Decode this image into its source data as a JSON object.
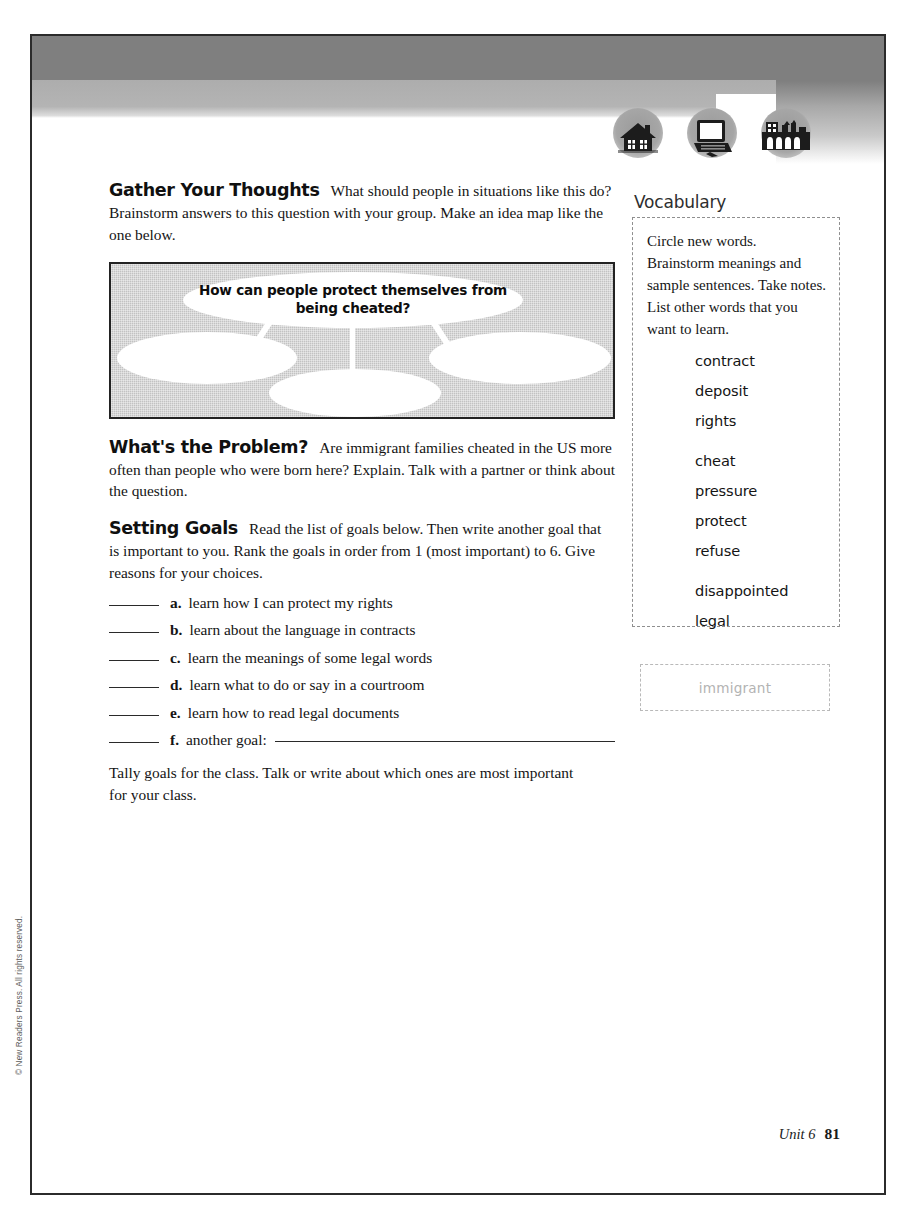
{
  "page": {
    "footer_unit": "Unit 6",
    "footer_page_number": "81",
    "copyright": "© New Readers Press. All rights reserved."
  },
  "header": {
    "icons": [
      {
        "name": "house-icon",
        "label": "house"
      },
      {
        "name": "computer-icon",
        "label": "computer"
      },
      {
        "name": "city-buildings-icon",
        "label": "city buildings"
      }
    ]
  },
  "sections": [
    {
      "heading": "Gather Your Thoughts",
      "body": "What should people in situations like this do? Brainstorm answers to this question with your group. Make an idea map like the one below."
    },
    {
      "heading": "What's the Problem?",
      "body": "Are immigrant families cheated in the US more often than people who were born here? Explain. Talk with a partner or think about the question."
    },
    {
      "heading": "Setting Goals",
      "body": "Read the list of goals below. Then write another goal that is important to you. Rank the goals in order from 1 (most important) to 6. Give reasons for your choices."
    }
  ],
  "idea_map": {
    "center_text": "How can people protect themselves from being cheated?",
    "empty_bubbles": 3
  },
  "goals": {
    "items": [
      {
        "letter": "a.",
        "text": "learn how I can protect my rights",
        "has_fill_line": false
      },
      {
        "letter": "b.",
        "text": "learn about the language in contracts",
        "has_fill_line": false
      },
      {
        "letter": "c.",
        "text": "learn the meanings of some legal words",
        "has_fill_line": false
      },
      {
        "letter": "d.",
        "text": "learn what to do or say in a courtroom",
        "has_fill_line": false
      },
      {
        "letter": "e.",
        "text": "learn how to read legal documents",
        "has_fill_line": false
      },
      {
        "letter": "f.",
        "text": "another goal:",
        "has_fill_line": true
      }
    ],
    "tally_text": "Tally goals for the class. Talk or write about which ones are most important for your class."
  },
  "vocabulary": {
    "title": "Vocabulary",
    "instructions": "Circle new words. Brainstorm meanings and sample sentences. Take notes. List other words that you want to learn.",
    "words": [
      {
        "word": "contract",
        "group": 1
      },
      {
        "word": "deposit",
        "group": 1
      },
      {
        "word": "rights",
        "group": 1
      },
      {
        "word": "cheat",
        "group": 2
      },
      {
        "word": "pressure",
        "group": 2
      },
      {
        "word": "protect",
        "group": 2
      },
      {
        "word": "refuse",
        "group": 2
      },
      {
        "word": "disappointed",
        "group": 3
      },
      {
        "word": "legal",
        "group": 3
      }
    ],
    "note_box_text": "immigrant"
  },
  "colors": {
    "header_gray_dark": "#7f7f7f",
    "header_gray_light": "#b4b4b4",
    "idea_map_fill": "#c2c2c2",
    "border_dark": "#2b2b2b"
  }
}
